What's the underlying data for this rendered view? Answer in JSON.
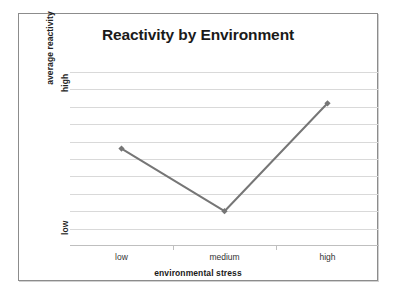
{
  "chart_data": {
    "type": "line",
    "title": "Reactivity by Environment",
    "xlabel": "environmental stress",
    "ylabel": "average reactivity",
    "categories": [
      "low",
      "medium",
      "high"
    ],
    "values": [
      5.6,
      2.0,
      8.2
    ],
    "series": [
      {
        "name": "average reactivity",
        "values": [
          5.6,
          2.0,
          8.2
        ]
      }
    ],
    "ylim": [
      0,
      10
    ],
    "y_tick_labels": [
      "low",
      "high"
    ],
    "y_tick_values": [
      1.2,
      9.0
    ],
    "x_tick_labels": [
      "low",
      "medium",
      "high"
    ],
    "grid": true,
    "gridline_count": 10,
    "legend": null,
    "legend_position": "none",
    "line_color": "#767676",
    "marker": "diamond",
    "marker_color": "#767676",
    "gridline_color": "#d9d9d9",
    "axis_color": "#bfbfbf",
    "border_color": "#8c8c8c",
    "background": "#ffffff"
  },
  "chart": {
    "title": "Reactivity by Environment",
    "y_axis": {
      "title": "average reactivity",
      "tick_high": "high",
      "tick_low": "low"
    },
    "x_axis": {
      "title": "environmental stress",
      "ticks": [
        "low",
        "medium",
        "high"
      ]
    }
  }
}
